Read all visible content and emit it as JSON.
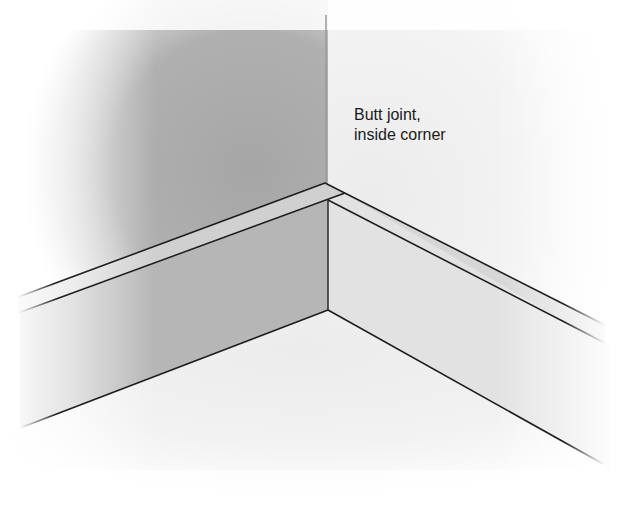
{
  "diagram": {
    "title": "Butt joint, inside corner",
    "label": {
      "line1": "Butt joint,",
      "line2": "inside corner"
    },
    "elements": [
      "left-wall",
      "right-wall",
      "floor",
      "left-baseboard",
      "right-baseboard",
      "corner-edge"
    ],
    "colors": {
      "left_wall": "#a9a9a9",
      "right_wall": "#f1f1f1",
      "baseboard_left_face": "#b8b8b8",
      "baseboard_right_face": "#dedede",
      "baseboard_top": "#cfcfcf",
      "floor": "#f4f4f4",
      "lines": "#1e1e1e",
      "text": "#1a1a1a"
    }
  }
}
